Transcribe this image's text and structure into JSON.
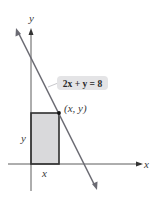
{
  "diagram": {
    "equation_label": "2x + y = 8",
    "point_label": "(x, y)",
    "axes": {
      "x_label": "x",
      "y_label": "y"
    },
    "rectangle": {
      "width_label": "x",
      "height_label": "y"
    },
    "colors": {
      "line": "#6b6b73",
      "axis": "#333333",
      "rect_fill": "#d9d9db",
      "rect_stroke": "#2e2e2e",
      "label_box": "#e4e4e6"
    }
  }
}
